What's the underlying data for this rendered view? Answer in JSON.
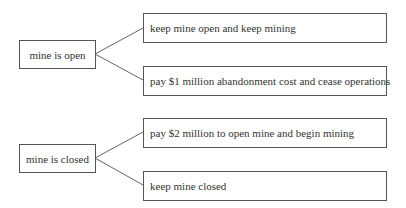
{
  "diagram": {
    "groups": [
      {
        "state": "mine is open",
        "actions": [
          "keep mine open and keep mining",
          "pay $1 million abandonment cost and cease operations"
        ]
      },
      {
        "state": "mine is closed",
        "actions": [
          "pay $2 million to open mine and begin mining",
          "keep mine closed"
        ]
      }
    ]
  }
}
